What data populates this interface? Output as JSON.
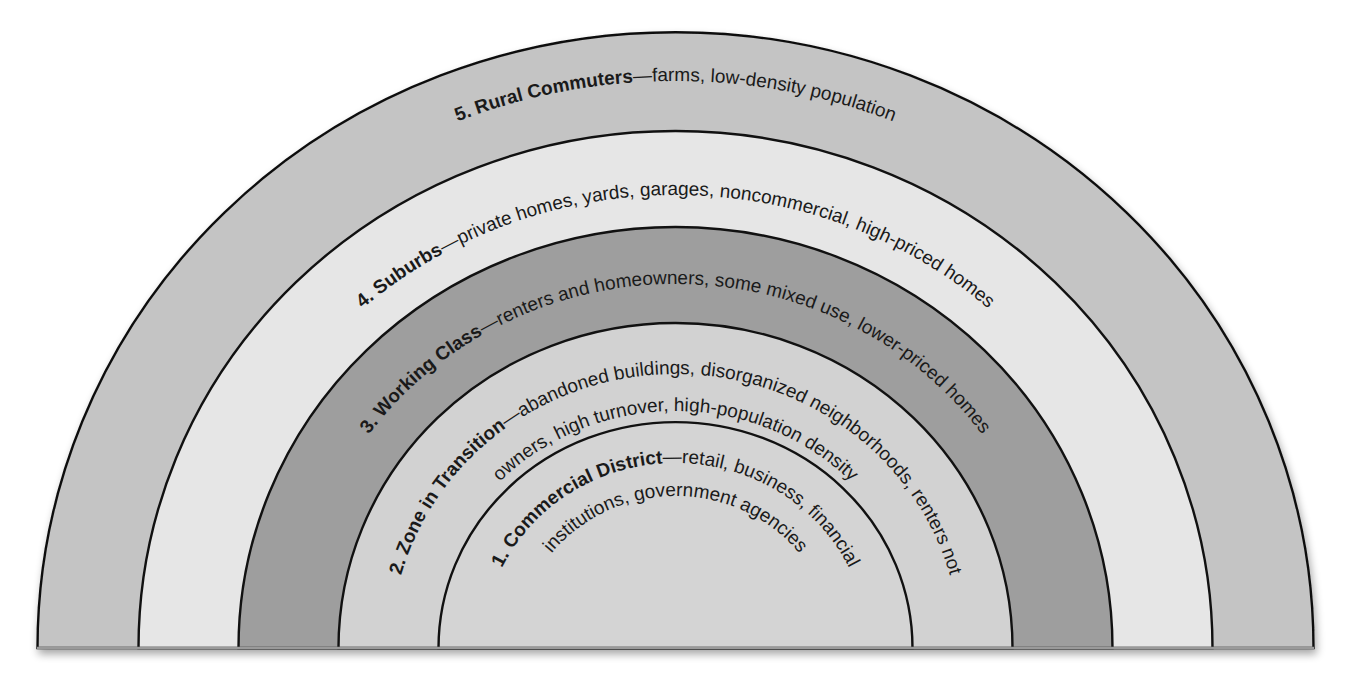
{
  "diagram": {
    "type": "concentric-zone-model",
    "center": {
      "x": 675.5,
      "y": 648
    },
    "baseline_y": 648,
    "zones": [
      {
        "number": "5.",
        "title": "Rural Commuters",
        "title_full": "5. Rural Commuters",
        "dash": "—",
        "description_lines": [
          "farms, low-density population"
        ],
        "fill": "#c4c4c4",
        "rx": 638,
        "ry": 616
      },
      {
        "number": "4.",
        "title": "Suburbs",
        "title_full": "4. Suburbs",
        "dash": "—",
        "description_lines": [
          "private homes, yards, garages, noncommercial, high-priced homes"
        ],
        "fill": "#e6e6e6",
        "rx": 537,
        "ry": 517
      },
      {
        "number": "3.",
        "title": "Working Class",
        "title_full": "3. Working Class",
        "dash": "—",
        "description_lines": [
          "renters and homeowners, some mixed use, lower-priced homes"
        ],
        "fill": "#9e9e9e",
        "rx": 437,
        "ry": 421
      },
      {
        "number": "2.",
        "title": "Zone in Transition",
        "title_full": "2. Zone in Transition",
        "dash": "—",
        "description_lines": [
          "abandoned buildings, disorganized neighborhoods, renters not",
          "owners, high turnover, high-population density"
        ],
        "fill": "#d2d2d2",
        "rx": 337,
        "ry": 325
      },
      {
        "number": "1.",
        "title": "Commercial District",
        "title_full": "1. Commercial District",
        "dash": "—",
        "description_lines": [
          "retail, business, financial",
          "institutions, government agencies"
        ],
        "fill": "#d4d4d4",
        "rx": 237,
        "ry": 226
      }
    ],
    "labels": {
      "z5_line1_title": "5. Rural Commuters",
      "z5_line1_rest": "—farms, low-density population",
      "z4_line1_title": "4. Suburbs",
      "z4_line1_rest": "—private homes, yards, garages, noncommercial, high-priced homes",
      "z3_line1_title": "3. Working Class",
      "z3_line1_rest": "—renters and homeowners, some mixed use, lower-priced homes",
      "z2_line1_title": "2. Zone in Transition",
      "z2_line1_rest": "—abandoned buildings, disorganized neighborhoods, renters not",
      "z2_line2": "owners, high turnover, high-population density",
      "z1_line1_title": "1. Commercial District",
      "z1_line1_rest": "—retail, business, financial",
      "z1_line2": "institutions, government agencies"
    },
    "colors": {
      "ring_stroke": "#111111",
      "text": "#1a1a1a",
      "background": "#ffffff"
    }
  }
}
